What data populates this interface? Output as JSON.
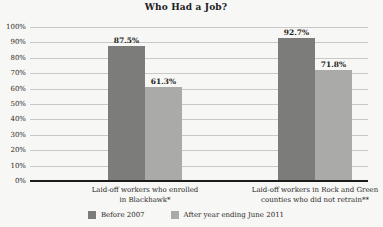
{
  "chart_data": {
    "type": "bar",
    "title": "Who Had a Job?",
    "xlabel": "",
    "ylabel": "",
    "ylim": [
      0,
      100
    ],
    "ytick_labels": [
      "100%",
      "90%",
      "80%",
      "70%",
      "60%",
      "50%",
      "40%",
      "30%",
      "20%",
      "10%",
      "0%"
    ],
    "ytick_values": [
      100,
      90,
      80,
      70,
      60,
      50,
      40,
      30,
      20,
      10,
      0
    ],
    "grid": true,
    "legend_position": "bottom",
    "categories": [
      "Laid-off workers who enrolled\nin Blackhawk*",
      "Laid-off workers in Rock and Green\ncounties who did not retrain**"
    ],
    "series": [
      {
        "name": "Before 2007",
        "color": "#7c7c7a",
        "values": [
          87.5,
          92.7
        ],
        "labels": [
          "87.5%",
          "92.7%"
        ]
      },
      {
        "name": "After year ending June 2011",
        "color": "#aaaaa8",
        "values": [
          61.3,
          71.8
        ],
        "labels": [
          "61.3%",
          "71.8%"
        ]
      }
    ]
  },
  "colors": {
    "background": "#f7f7f5",
    "gridline": "#c9c9c7",
    "axis": "#1c1c1a",
    "text": "#2a2a28",
    "series_before_2007": "#7c7c7a",
    "series_after_2011": "#aaaaa8"
  }
}
